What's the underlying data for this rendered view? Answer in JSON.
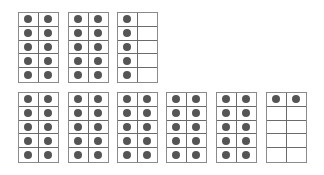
{
  "colors": {
    "dot": "#555555",
    "border": "#6a6a6a",
    "background": "#ffffff"
  },
  "frames": [
    {
      "row": 1,
      "index": 1,
      "x": 18,
      "y": 12,
      "filled": [
        1,
        1,
        1,
        1,
        1,
        1,
        1,
        1,
        1,
        1
      ]
    },
    {
      "row": 1,
      "index": 2,
      "x": 68,
      "y": 12,
      "filled": [
        1,
        1,
        1,
        1,
        1,
        1,
        1,
        1,
        1,
        1
      ]
    },
    {
      "row": 1,
      "index": 3,
      "x": 117,
      "y": 12,
      "filled": [
        1,
        0,
        1,
        0,
        1,
        0,
        1,
        0,
        1,
        0
      ]
    },
    {
      "row": 2,
      "index": 1,
      "x": 18,
      "y": 92,
      "filled": [
        1,
        1,
        1,
        1,
        1,
        1,
        1,
        1,
        1,
        1
      ]
    },
    {
      "row": 2,
      "index": 2,
      "x": 68,
      "y": 92,
      "filled": [
        1,
        1,
        1,
        1,
        1,
        1,
        1,
        1,
        1,
        1
      ]
    },
    {
      "row": 2,
      "index": 3,
      "x": 117,
      "y": 92,
      "filled": [
        1,
        1,
        1,
        1,
        1,
        1,
        1,
        1,
        1,
        1
      ]
    },
    {
      "row": 2,
      "index": 4,
      "x": 166,
      "y": 92,
      "filled": [
        1,
        1,
        1,
        1,
        1,
        1,
        1,
        1,
        1,
        1
      ]
    },
    {
      "row": 2,
      "index": 5,
      "x": 216,
      "y": 92,
      "filled": [
        1,
        1,
        1,
        1,
        1,
        1,
        1,
        1,
        1,
        1
      ]
    },
    {
      "row": 2,
      "index": 6,
      "x": 266,
      "y": 92,
      "filled": [
        1,
        1,
        0,
        0,
        0,
        0,
        0,
        0,
        0,
        0
      ]
    }
  ],
  "totals": {
    "top_row": 25,
    "bottom_row": 52
  }
}
